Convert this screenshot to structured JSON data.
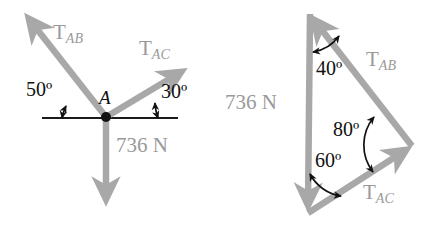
{
  "figure": {
    "type": "physics-force-diagram",
    "background_color": "#ffffff",
    "arrow_color": "#a8a8a8",
    "line_color": "#1a1a1a",
    "text_color_dark": "#111111",
    "text_color_gray": "#9a9a9a"
  },
  "left_diagram": {
    "name": "free-body-diagram",
    "point_label": "A",
    "forces": [
      {
        "id": "TAB",
        "symbol": "T",
        "subscript": "AB",
        "angle_deg": 50,
        "direction": "up-left"
      },
      {
        "id": "TAC",
        "symbol": "T",
        "subscript": "AC",
        "angle_deg": 30,
        "direction": "up-right"
      },
      {
        "id": "W",
        "label": "736 N",
        "direction": "down"
      }
    ],
    "angles": [
      {
        "id": "angle-left",
        "text": "50º",
        "between": "TAB and horizontal"
      },
      {
        "id": "angle-right",
        "text": "30º",
        "between": "TAC and horizontal"
      }
    ],
    "weight_label": "736 N"
  },
  "right_diagram": {
    "name": "force-triangle",
    "sides": [
      {
        "id": "W",
        "label": "736 N",
        "direction": "down",
        "position": "left"
      },
      {
        "id": "TAB",
        "symbol": "T",
        "subscript": "AB",
        "direction": "up-left",
        "position": "upper-right"
      },
      {
        "id": "TAC",
        "symbol": "T",
        "subscript": "AC",
        "direction": "up-right",
        "position": "lower-right"
      }
    ],
    "angles": [
      {
        "id": "angle-top",
        "text": "40º",
        "vertex": "top"
      },
      {
        "id": "angle-right",
        "text": "80º",
        "vertex": "right"
      },
      {
        "id": "angle-bottom",
        "text": "60º",
        "vertex": "bottom"
      }
    ],
    "weight_label": "736 N"
  }
}
